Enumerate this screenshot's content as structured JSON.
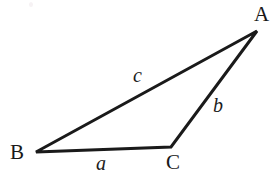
{
  "figure": {
    "type": "geometry-diagram",
    "background_color": "#ffffff",
    "stroke_color": "#1a1a1a",
    "canvas": {
      "width": 274,
      "height": 176
    }
  },
  "vertices": [
    {
      "id": "A",
      "label": "A",
      "x": 257,
      "y": 31
    },
    {
      "id": "B",
      "label": "B",
      "x": 36,
      "y": 152
    },
    {
      "id": "C",
      "label": "C",
      "x": 171,
      "y": 147
    }
  ],
  "sides": [
    {
      "id": "a",
      "label": "a",
      "from": "B",
      "to": "C",
      "label_x": 103,
      "label_y": 163
    },
    {
      "id": "b",
      "label": "b",
      "from": "C",
      "to": "A",
      "label_x": 219,
      "label_y": 105
    },
    {
      "id": "c",
      "label": "c",
      "from": "B",
      "to": "A",
      "label_x": 139,
      "label_y": 75
    }
  ],
  "geometry": {
    "polygon_points": "36,152 257,31 171,147",
    "line_width": 3
  }
}
